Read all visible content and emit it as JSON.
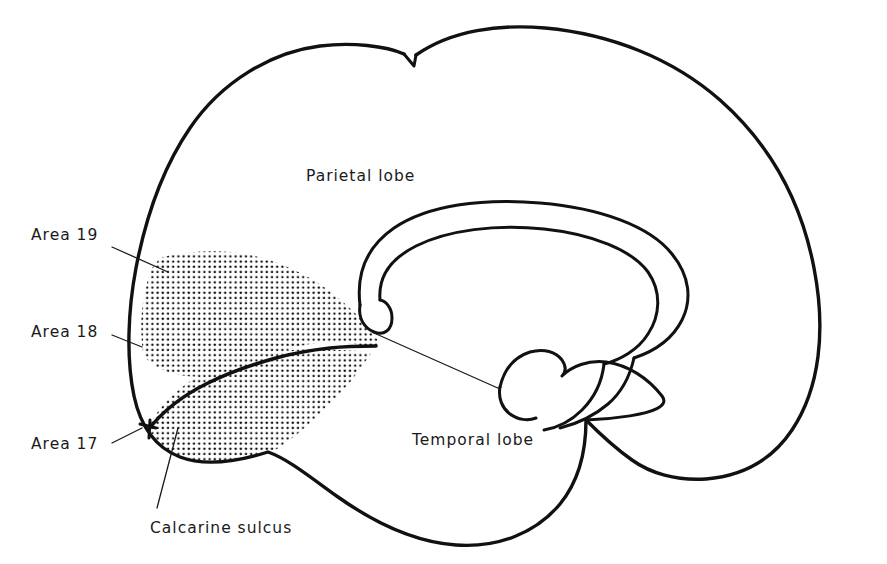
{
  "figure": {
    "kind": "medial-view-brain-diagram",
    "background_color": "#ffffff",
    "ink_color": "#111111",
    "stipple_color": "#141414"
  },
  "labels": {
    "area_19": "Area 19",
    "area_18": "Area 18",
    "area_17": "Area 17",
    "calcarine_sulcus": "Calcarine sulcus",
    "parietal_lobe": "Parietal lobe",
    "temporal_lobe": "Temporal lobe"
  },
  "label_positions": {
    "area_19": {
      "x": 31,
      "y": 228
    },
    "area_18": {
      "x": 31,
      "y": 325
    },
    "area_17": {
      "x": 31,
      "y": 437
    },
    "calcarine_sulcus": {
      "x": 150,
      "y": 521
    },
    "parietal_lobe": {
      "x": 306,
      "y": 169
    },
    "temporal_lobe": {
      "x": 412,
      "y": 433
    }
  },
  "regions": {
    "area_19_description": "Outer stippled band of occipital cortex",
    "area_18_description": "Middle stippled band of occipital cortex",
    "area_17_description": "Primary visual cortex bordering the calcarine sulcus",
    "calcarine_description": "Sulcus dividing the stippled occipital wedge",
    "corpus_callosum_description": "Central arching double-outlined structure"
  }
}
